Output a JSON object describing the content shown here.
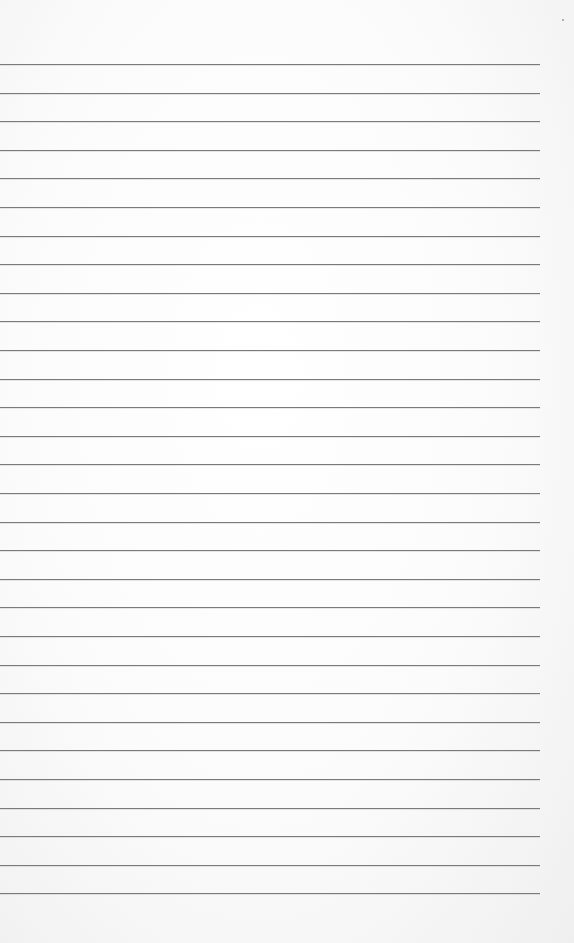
{
  "page": {
    "type": "lined paper",
    "rule_count": 30,
    "rule_color": "#7a7a7a",
    "paper_color": "#ffffff",
    "text": []
  }
}
